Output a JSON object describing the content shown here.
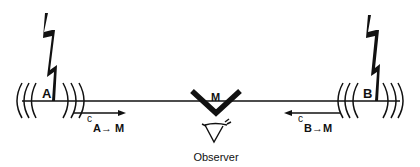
{
  "diagram": {
    "type": "light-signal-simultaneity",
    "events": [
      {
        "id": "A",
        "label": "A",
        "signal_label_main": "c",
        "signal_label_sub": "A→ M",
        "direction": "right"
      },
      {
        "id": "B",
        "label": "B",
        "signal_label_main": "c",
        "signal_label_sub": "B→M",
        "direction": "left"
      }
    ],
    "mirror": {
      "label": "M"
    },
    "observer": {
      "label": "Observer",
      "icon": "eye-icon"
    },
    "source_icon": "lightning-bolt-icon",
    "colors": {
      "ink": "#111111",
      "background": "#ffffff"
    }
  }
}
